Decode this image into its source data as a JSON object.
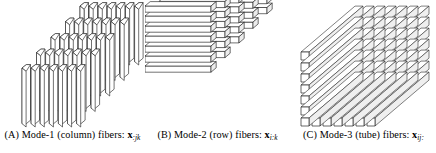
{
  "figure": {
    "kind": "tensor-fiber-diagram",
    "background_color": "#ffffff",
    "line_color": "#1a1a1a",
    "face_fill": "#ffffff",
    "shade_fill": "#e8e8e8",
    "panels": [
      {
        "id": "a",
        "tag": "(A)",
        "mode_label": "Mode-1 (column) fibers:",
        "symbol": "x",
        "subscript": ":jk",
        "caption_full": "(A) Mode-1 (column) fibers: x:jk",
        "fiber_orientation": "vertical",
        "grid_cols": 7,
        "grid_depth": 5
      },
      {
        "id": "b",
        "tag": "(B)",
        "mode_label": "Mode-2 (row) fibers:",
        "symbol": "x",
        "subscript": "i:k",
        "caption_full": "(B) Mode-2 (row) fibers: xi:k",
        "fiber_orientation": "horizontal",
        "grid_rows": 7,
        "grid_depth": 5
      },
      {
        "id": "c",
        "tag": "(C)",
        "mode_label": "Mode-3 (tube) fibers:",
        "symbol": "x",
        "subscript": "ij:",
        "caption_full": "(C) Mode-3 (tube) fibers: xij:",
        "fiber_orientation": "depth",
        "grid_cols": 7,
        "grid_rows": 7
      }
    ]
  }
}
